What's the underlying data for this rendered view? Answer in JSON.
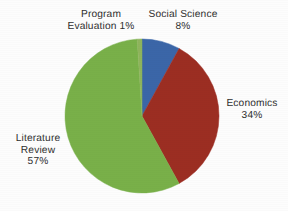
{
  "background_color": "#fdfdfd",
  "text_color": "#2e2e2e",
  "chart_data": {
    "type": "pie",
    "title": "",
    "subtitle": "",
    "xlabel": "",
    "ylabel": "",
    "grid": false,
    "legend_position": "none",
    "label_style": "external",
    "start_angle_deg": 0,
    "direction": "clockwise",
    "center": {
      "x": 142,
      "y": 116
    },
    "radius": 77,
    "categories": [
      "Social Science",
      "Economics",
      "Literature Review",
      "Program Evaluation"
    ],
    "values": [
      8,
      34,
      57,
      1
    ],
    "unit": "%",
    "colors": [
      "#3a66a8",
      "#9c2d22",
      "#79b04a",
      "#8fb45c"
    ],
    "slices": [
      {
        "name": "Social Science",
        "value": 8,
        "value_text": "8%",
        "color": "#3a66a8",
        "label_lines": [
          "Social Science",
          "8%"
        ]
      },
      {
        "name": "Economics",
        "value": 34,
        "value_text": "34%",
        "color": "#9c2d22",
        "label_lines": [
          "Economics",
          "34%"
        ]
      },
      {
        "name": "Literature Review",
        "value": 57,
        "value_text": "57%",
        "color": "#79b04a",
        "label_lines": [
          "Literature",
          "Review",
          "57%"
        ]
      },
      {
        "name": "Program Evaluation",
        "value": 1,
        "value_text": "1%",
        "color": "#8fb45c",
        "label_lines": [
          "Program",
          "Evaluation 1%"
        ]
      }
    ]
  },
  "labels": {
    "program_evaluation": {
      "line1": "Program",
      "line2": "Evaluation 1%"
    },
    "social_science": {
      "line1": "Social Science",
      "line2": "8%"
    },
    "economics": {
      "line1": "Economics",
      "line2": "34%"
    },
    "literature_review": {
      "line1": "Literature",
      "line2": "Review",
      "line3": "57%"
    }
  }
}
